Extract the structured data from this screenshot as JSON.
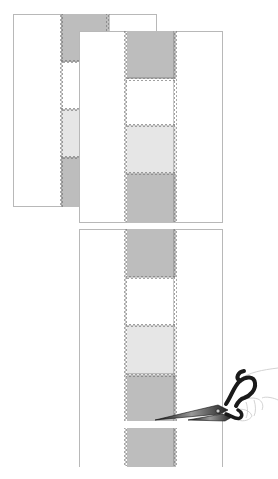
{
  "figure": {
    "colors": {
      "dark": "#bdbdbd",
      "white": "#ffffff",
      "light": "#e6e6e6",
      "panel_border": "#b8b8b8",
      "zigzag": "#666666"
    },
    "panels": [
      {
        "name": "back-panel",
        "blocks": [
          "dark",
          "white",
          "light",
          "dark"
        ]
      },
      {
        "name": "front-panel",
        "blocks": [
          "dark",
          "white",
          "light",
          "dark"
        ]
      },
      {
        "name": "cut-panel",
        "blocks": [
          "dark",
          "white",
          "light",
          "dark",
          "gap",
          "dark"
        ]
      }
    ],
    "tool": "scissors"
  }
}
